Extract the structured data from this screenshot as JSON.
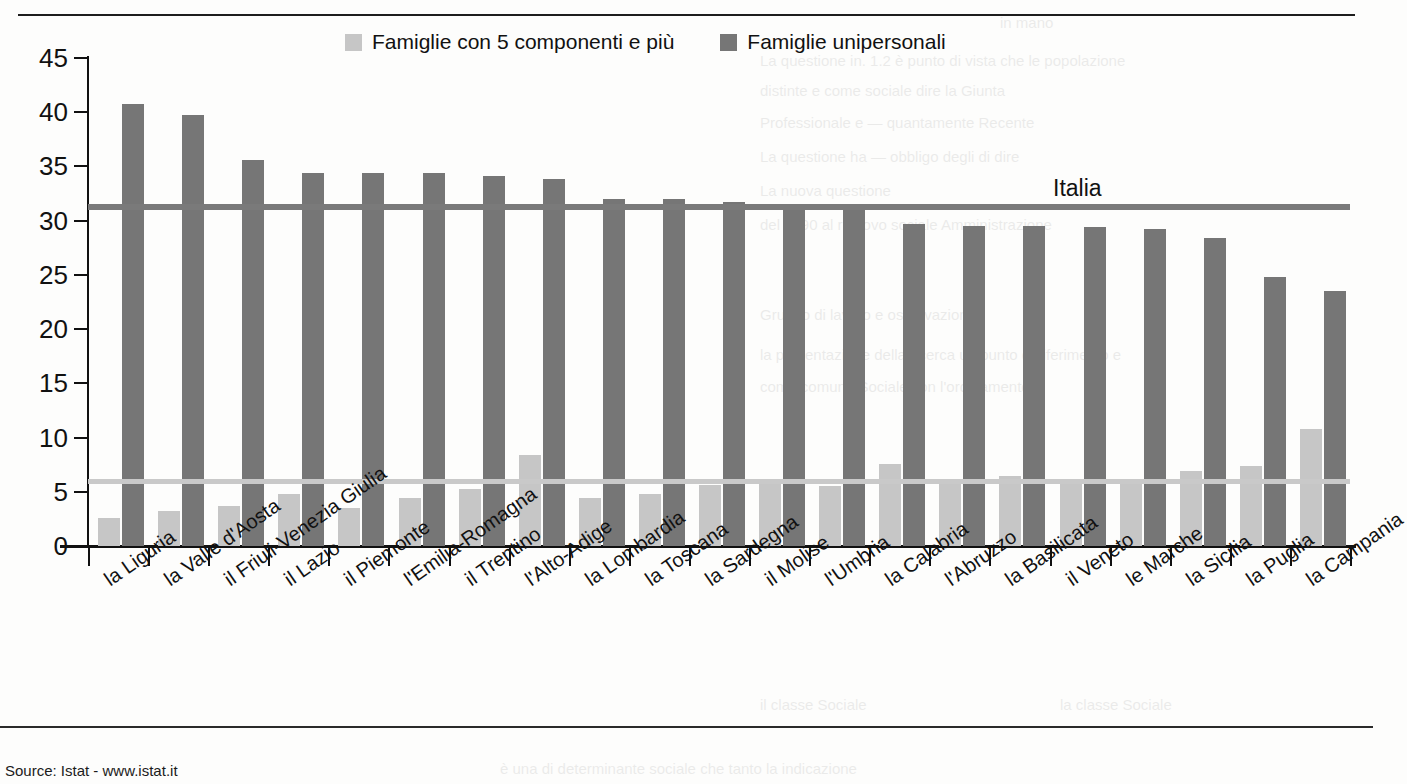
{
  "source_note": "Source: Istat - www.istat.it",
  "legend": [
    {
      "label": "Famiglie con 5 componenti e più",
      "color": "#c6c6c6",
      "key": "five_plus"
    },
    {
      "label": "Famiglie unipersonali",
      "color": "#767676",
      "key": "single"
    }
  ],
  "reference": {
    "italia_label": "Italia",
    "italia_single_value": 31.0,
    "italia_five_plus_value": 5.7
  },
  "chart_data": {
    "type": "bar",
    "title": "",
    "xlabel": "",
    "ylabel": "",
    "ylim": [
      0,
      45
    ],
    "yticks": [
      0,
      5,
      10,
      15,
      20,
      25,
      30,
      35,
      40,
      45
    ],
    "grid": false,
    "legend_position": "top-center",
    "categories": [
      "la Liguria",
      "la Valle d'Aosta",
      "il Friuli-Venezia Giulia",
      "il Lazio",
      "il Piemonte",
      "l'Emilia-Romagna",
      "il Trentino",
      "l'Alto-Adige",
      "la Lombardia",
      "la Toscana",
      "la Sardegna",
      "il Molise",
      "l'Umbria",
      "la Calabria",
      "l'Abruzzo",
      "la Basilicata",
      "il Veneto",
      "le Marche",
      "la Sicilia",
      "la Puglia",
      "la Campania"
    ],
    "series": [
      {
        "name": "Famiglie con 5 componenti e più",
        "color": "#c6c6c6",
        "values": [
          2.6,
          3.2,
          3.7,
          4.8,
          3.5,
          4.4,
          5.3,
          8.4,
          4.4,
          4.8,
          5.6,
          5.9,
          5.5,
          7.6,
          6.2,
          6.5,
          5.7,
          6.0,
          6.9,
          7.4,
          10.8
        ]
      },
      {
        "name": "Famiglie unipersonali",
        "color": "#767676",
        "values": [
          40.8,
          39.7,
          35.6,
          34.4,
          34.4,
          34.4,
          34.1,
          33.8,
          32.0,
          32.0,
          31.7,
          31.5,
          31.2,
          29.7,
          29.5,
          29.5,
          29.4,
          29.2,
          28.4,
          24.8,
          23.5
        ]
      }
    ],
    "annotations": [
      {
        "text": "Italia",
        "type": "reference-line-label",
        "value": 31.0
      }
    ]
  },
  "bleed_text": [
    "in mano",
    "3. La Giunta in. 1.2 è punto di vista che le popolazione distinte e",
    "4. Professionale e                      quantamente Recente",
    "5. La questione ha                          obbligo degli di dire",
    "6. La nuova questione del 1990 al rinnovo sociale Amministrazione",
    "Gruppo di lavoro e osservazione",
    "la presentazione della ricerca un punto di riferimento e, è noto",
    "come comune Sociale                          con l'ordinamento"
  ]
}
